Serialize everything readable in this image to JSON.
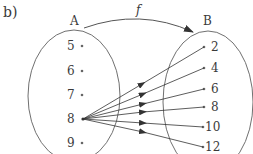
{
  "part_label": "b)",
  "function_label": "f",
  "set_a": {
    "label": "A",
    "elements": [
      "5",
      "6",
      "7",
      "8",
      "9"
    ]
  },
  "set_b": {
    "label": "B",
    "elements": [
      "2",
      "4",
      "6",
      "8",
      "10",
      "12"
    ]
  },
  "mapping": {
    "from": "8",
    "to": [
      "2",
      "4",
      "6",
      "8",
      "10",
      "12"
    ]
  },
  "colors": {
    "stroke": "#707070",
    "text": "#3a3a3a",
    "arrow": "#333333"
  }
}
